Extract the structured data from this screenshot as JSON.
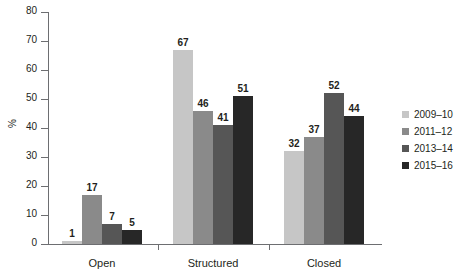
{
  "chart_data": {
    "type": "bar",
    "title": "",
    "subtitle": "",
    "xlabel": "",
    "ylabel": "%",
    "ylim": [
      0,
      80
    ],
    "yticks": [
      0,
      10,
      20,
      30,
      40,
      50,
      60,
      70,
      80
    ],
    "grid": false,
    "legend_position": "right",
    "categories": [
      "Open",
      "Structured",
      "Closed"
    ],
    "series": [
      {
        "name": "2009–10",
        "color": "#c6c6c6",
        "values": [
          1,
          67,
          32
        ]
      },
      {
        "name": "2011–12",
        "color": "#8a8a8a",
        "values": [
          17,
          46,
          37
        ]
      },
      {
        "name": "2013–14",
        "color": "#565656",
        "values": [
          7,
          41,
          52
        ]
      },
      {
        "name": "2015–16",
        "color": "#272727",
        "values": [
          5,
          51,
          44
        ]
      }
    ]
  },
  "legend": {
    "items": [
      {
        "label": "2009–10",
        "color": "#c6c6c6"
      },
      {
        "label": "2011–12",
        "color": "#8a8a8a"
      },
      {
        "label": "2013–14",
        "color": "#565656"
      },
      {
        "label": "2015–16",
        "color": "#272727"
      }
    ]
  },
  "axes": {
    "y_label": "%",
    "y_ticks": [
      "0",
      "10",
      "20",
      "30",
      "40",
      "50",
      "60",
      "70",
      "80"
    ],
    "x_categories": [
      "Open",
      "Structured",
      "Closed"
    ]
  },
  "colors": {
    "axis": "#6d6e71",
    "text": "#231f20",
    "background": "#ffffff"
  }
}
